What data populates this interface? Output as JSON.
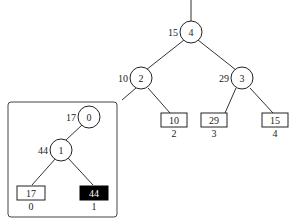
{
  "main_tree": {
    "root_edge": true,
    "nodes": [
      {
        "id": "4",
        "weight": "15"
      },
      {
        "id": "2",
        "weight": "10"
      },
      {
        "id": "3",
        "weight": "29"
      }
    ],
    "leaves": [
      {
        "value": "10",
        "index": "2"
      },
      {
        "value": "29",
        "index": "3"
      },
      {
        "value": "15",
        "index": "4"
      }
    ]
  },
  "sub_tree": {
    "nodes": [
      {
        "id": "0",
        "weight": "17"
      },
      {
        "id": "1",
        "weight": "44"
      }
    ],
    "leaves": [
      {
        "value": "17",
        "index": "0",
        "highlighted": false
      },
      {
        "value": "44",
        "index": "1",
        "highlighted": true
      }
    ]
  },
  "colors": {
    "stroke": "#222222",
    "highlight_fill": "#000000",
    "highlight_text": "#ffffff"
  }
}
